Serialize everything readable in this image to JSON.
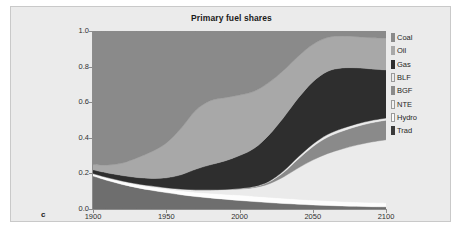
{
  "figure": {
    "panel_letter": "c",
    "panel_background": "#ebebeb",
    "page_background": "#ffffff"
  },
  "chart_data": {
    "type": "area",
    "stacked": true,
    "title": "Primary fuel shares",
    "xlabel": "",
    "ylabel": "",
    "xlim": [
      1900,
      2100
    ],
    "ylim": [
      0.0,
      1.0
    ],
    "grid": false,
    "legend_position": "right",
    "x_ticks": [
      "1900",
      "1950",
      "2000",
      "2050",
      "2100"
    ],
    "x_tick_values": [
      1900,
      1950,
      2000,
      2050,
      2100
    ],
    "y_ticks": [
      "0.0",
      "0.2",
      "0.4",
      "0.6",
      "0.8",
      "1.0"
    ],
    "y_tick_values": [
      0.0,
      0.2,
      0.4,
      0.6,
      0.8,
      1.0
    ],
    "x": [
      1900,
      1910,
      1920,
      1930,
      1940,
      1950,
      1960,
      1970,
      1980,
      1990,
      2000,
      2010,
      2020,
      2030,
      2040,
      2050,
      2060,
      2070,
      2080,
      2090,
      2100
    ],
    "legend": [
      {
        "name": "Coal",
        "color": "#8a8a8a"
      },
      {
        "name": "Oil",
        "color": "#a8a8a8"
      },
      {
        "name": "Gas",
        "color": "#2e2e2e"
      },
      {
        "name": "BLF",
        "color": "#ebebeb"
      },
      {
        "name": "BGF",
        "color": "#8a8a8a"
      },
      {
        "name": "NTE",
        "color": "#f2f2f2"
      },
      {
        "name": "Hydro",
        "color": "#fbfbfb"
      },
      {
        "name": "Trad",
        "color": "#3a3a3a"
      }
    ],
    "series": [
      {
        "name": "Trad",
        "color": "#6e6e6e",
        "values": [
          0.185,
          0.16,
          0.138,
          0.12,
          0.105,
          0.092,
          0.08,
          0.07,
          0.062,
          0.055,
          0.048,
          0.042,
          0.036,
          0.031,
          0.027,
          0.023,
          0.02,
          0.017,
          0.015,
          0.013,
          0.012
        ]
      },
      {
        "name": "Hydro",
        "color": "#fdfdfd",
        "values": [
          0.01,
          0.012,
          0.014,
          0.016,
          0.018,
          0.02,
          0.022,
          0.024,
          0.026,
          0.028,
          0.03,
          0.03,
          0.03,
          0.029,
          0.028,
          0.027,
          0.026,
          0.025,
          0.024,
          0.023,
          0.022
        ]
      },
      {
        "name": "NTE",
        "color": "#ebebeb",
        "values": [
          0.005,
          0.005,
          0.006,
          0.006,
          0.007,
          0.008,
          0.01,
          0.014,
          0.02,
          0.026,
          0.034,
          0.048,
          0.075,
          0.12,
          0.175,
          0.225,
          0.265,
          0.295,
          0.32,
          0.34,
          0.355
        ]
      },
      {
        "name": "BGF",
        "color": "#8a8a8a",
        "values": [
          0.0,
          0.0,
          0.0,
          0.0,
          0.0,
          0.0,
          0.0,
          0.0,
          0.0,
          0.001,
          0.002,
          0.004,
          0.01,
          0.025,
          0.05,
          0.075,
          0.092,
          0.1,
          0.105,
          0.108,
          0.11
        ]
      },
      {
        "name": "BLF",
        "color": "#ebebeb",
        "values": [
          0.0,
          0.0,
          0.0,
          0.0,
          0.0,
          0.0,
          0.0,
          0.0,
          0.0,
          0.0,
          0.001,
          0.002,
          0.004,
          0.008,
          0.012,
          0.014,
          0.015,
          0.015,
          0.014,
          0.013,
          0.012
        ]
      },
      {
        "name": "Gas",
        "color": "#2e2e2e",
        "values": [
          0.02,
          0.025,
          0.03,
          0.035,
          0.042,
          0.055,
          0.08,
          0.115,
          0.14,
          0.16,
          0.185,
          0.215,
          0.26,
          0.3,
          0.33,
          0.35,
          0.355,
          0.34,
          0.315,
          0.29,
          0.27
        ]
      },
      {
        "name": "Oil",
        "color": "#a8a8a8",
        "values": [
          0.03,
          0.045,
          0.07,
          0.11,
          0.15,
          0.195,
          0.26,
          0.33,
          0.36,
          0.355,
          0.34,
          0.32,
          0.295,
          0.265,
          0.235,
          0.21,
          0.19,
          0.18,
          0.175,
          0.175,
          0.18
        ]
      },
      {
        "name": "Coal",
        "color": "#8a8a8a",
        "values": [
          0.75,
          0.753,
          0.742,
          0.713,
          0.678,
          0.63,
          0.548,
          0.447,
          0.392,
          0.375,
          0.36,
          0.339,
          0.29,
          0.222,
          0.143,
          0.076,
          0.037,
          0.028,
          0.032,
          0.038,
          0.039
        ]
      }
    ]
  }
}
